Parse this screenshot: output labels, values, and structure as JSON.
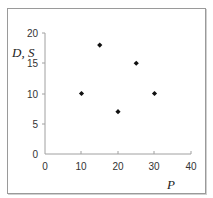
{
  "chart_data": {
    "type": "scatter",
    "title": "",
    "xlabel": "P",
    "ylabel": "D, S",
    "xlim": [
      0,
      40
    ],
    "ylim": [
      0,
      20
    ],
    "x_ticks": [
      0,
      10,
      20,
      30,
      40
    ],
    "y_ticks": [
      0,
      5,
      10,
      15,
      20
    ],
    "grid": false,
    "legend": null,
    "marker": "diamond",
    "marker_color": "#111111",
    "series": [
      {
        "name": "points",
        "points": [
          {
            "x": 10,
            "y": 10
          },
          {
            "x": 15,
            "y": 18
          },
          {
            "x": 20,
            "y": 7
          },
          {
            "x": 25,
            "y": 15
          },
          {
            "x": 30,
            "y": 10
          }
        ]
      }
    ]
  },
  "labels": {
    "x_axis": "P",
    "y_axis": "D, S",
    "x_ticks": [
      "0",
      "10",
      "20",
      "30",
      "40"
    ],
    "y_ticks": [
      "0",
      "5",
      "10",
      "15",
      "20"
    ]
  },
  "colors": {
    "axis": "#a0a0a0",
    "frame": "#9a9a9a",
    "marker": "#111111",
    "text": "#333333"
  }
}
